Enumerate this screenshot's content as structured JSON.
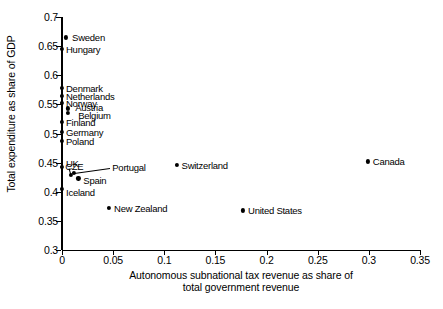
{
  "chart_data": {
    "type": "scatter",
    "title": "",
    "xlabel": "Autonomous subnational tax revenue as share of total government revenue",
    "xlabel_line1": "Autonomous subnational tax revenue as share of",
    "xlabel_line2": "total government revenue",
    "ylabel": "Total expenditure as share of GDP",
    "xlim": [
      0,
      0.35
    ],
    "ylim": [
      0.3,
      0.7
    ],
    "xticks": [
      "0",
      "0.05",
      "0.1",
      "0.15",
      "0.2",
      "0.25",
      "0.3",
      "0.35"
    ],
    "xtick_values": [
      0,
      0.05,
      0.1,
      0.15,
      0.2,
      0.25,
      0.3,
      0.35
    ],
    "yticks": [
      "0.3",
      "0.35",
      "0.4",
      "0.45",
      "0.5",
      "0.55",
      "0.6",
      "0.65",
      "0.7"
    ],
    "ytick_values": [
      0.3,
      0.35,
      0.4,
      0.45,
      0.5,
      0.55,
      0.6,
      0.65,
      0.7
    ],
    "grid": false,
    "legend": "none",
    "points": [
      {
        "label": "Sweden",
        "x": 0.004,
        "y": 0.665,
        "label_dx": 6,
        "label_dy": 0,
        "leader": false
      },
      {
        "label": "Hungary",
        "x": 0.0,
        "y": 0.645,
        "label_dx": 4,
        "label_dy": 0,
        "leader": false
      },
      {
        "label": "Denmark",
        "x": 0.0,
        "y": 0.578,
        "label_dx": 4,
        "label_dy": 0,
        "leader": false
      },
      {
        "label": "Netherlands",
        "x": 0.0,
        "y": 0.565,
        "label_dx": 4,
        "label_dy": 0,
        "leader": false
      },
      {
        "label": "Norway",
        "x": 0.0,
        "y": 0.552,
        "label_dx": 4,
        "label_dy": 0,
        "leader": false
      },
      {
        "label": "Austria",
        "x": 0.006,
        "y": 0.543,
        "label_dx": 7,
        "label_dy": -1,
        "leader": false
      },
      {
        "label": "Belgium",
        "x": 0.006,
        "y": 0.535,
        "label_dx": 10,
        "label_dy": 2,
        "leader": false
      },
      {
        "label": "Finland",
        "x": 0.0,
        "y": 0.52,
        "label_dx": 4,
        "label_dy": 0,
        "leader": false
      },
      {
        "label": "Germany",
        "x": 0.0,
        "y": 0.503,
        "label_dx": 4,
        "label_dy": 0,
        "leader": false
      },
      {
        "label": "Poland",
        "x": 0.0,
        "y": 0.487,
        "label_dx": 4,
        "label_dy": 0,
        "leader": false
      },
      {
        "label": "UK",
        "x": 0.0,
        "y": 0.443,
        "label_dx": 4,
        "label_dy": -4,
        "leader": false
      },
      {
        "label": "CZE",
        "x": 0.009,
        "y": 0.429,
        "label_dx": -6,
        "label_dy": -9,
        "leader": true,
        "leader_from_dx": -2,
        "leader_from_dy": -7
      },
      {
        "label": "Portugal",
        "x": 0.012,
        "y": 0.432,
        "label_dx": 38,
        "label_dy": -6,
        "leader": true,
        "leader_from_dx": 36,
        "leader_from_dy": -5
      },
      {
        "label": "Spain",
        "x": 0.016,
        "y": 0.423,
        "label_dx": 5,
        "label_dy": 2,
        "leader": false
      },
      {
        "label": "Iceland",
        "x": 0.0,
        "y": 0.405,
        "label_dx": 4,
        "label_dy": 3,
        "leader": false
      },
      {
        "label": "New Zealand",
        "x": 0.046,
        "y": 0.372,
        "label_dx": 5,
        "label_dy": 0,
        "leader": false
      },
      {
        "label": "Switzerland",
        "x": 0.112,
        "y": 0.446,
        "label_dx": 5,
        "label_dy": 0,
        "leader": false
      },
      {
        "label": "United States",
        "x": 0.177,
        "y": 0.368,
        "label_dx": 5,
        "label_dy": 0,
        "leader": false
      },
      {
        "label": "Canada",
        "x": 0.299,
        "y": 0.452,
        "label_dx": 5,
        "label_dy": 0,
        "leader": false
      }
    ]
  }
}
